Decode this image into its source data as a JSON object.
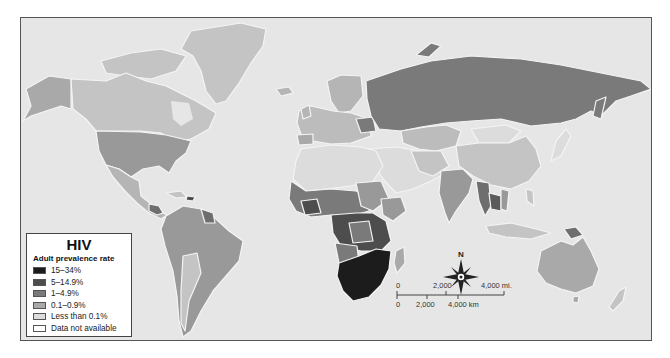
{
  "legend": {
    "title": "HIV",
    "subtitle": "Adult prevalence rate",
    "items": [
      {
        "label": "15–34%",
        "color": "#1c1c1c"
      },
      {
        "label": "5–14.9%",
        "color": "#4d4d4d"
      },
      {
        "label": "1–4.9%",
        "color": "#7a7a7a"
      },
      {
        "label": "0.1–0.9%",
        "color": "#a9a9a9"
      },
      {
        "label": "Less than 0.1%",
        "color": "#dcdcdc"
      },
      {
        "label": "Data not available",
        "color": "#ffffff"
      }
    ]
  },
  "compass": {
    "north_label": "N"
  },
  "scale_bar": {
    "miles": {
      "start": "0",
      "mid": "2,000",
      "end": "4,000 mi."
    },
    "km": {
      "start": "0",
      "mid": "2,000",
      "end": "4,000 km"
    }
  },
  "colors": {
    "ocean": "#e6e6e6",
    "frame_border": "#555555",
    "coast_halo": "#f4f4f4"
  },
  "regions": [
    {
      "name": "North America (Canada/Alaska/Greenland)",
      "category": "0.1–0.9%"
    },
    {
      "name": "United States",
      "category": "1–4.9%"
    },
    {
      "name": "Russia",
      "category": "1–4.9%"
    },
    {
      "name": "Southern Africa",
      "category": "15–34%"
    },
    {
      "name": "Central/East Africa",
      "category": "5–14.9%"
    },
    {
      "name": "West Africa",
      "category": "1–4.9%"
    },
    {
      "name": "North Africa / Middle East",
      "category": "Less than 0.1%"
    },
    {
      "name": "China",
      "category": "0.1–0.9%"
    },
    {
      "name": "India",
      "category": "1–4.9%"
    },
    {
      "name": "Southeast Asia",
      "category": "1–4.9%"
    },
    {
      "name": "Australia",
      "category": "0.1–0.9%"
    },
    {
      "name": "South America",
      "category": "0.1–0.9% / 1–4.9%"
    },
    {
      "name": "Europe",
      "category": "0.1–0.9%"
    }
  ]
}
